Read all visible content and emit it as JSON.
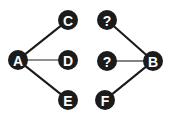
{
  "diagram": {
    "type": "node-link-graph-pair",
    "background_color": "#ffffff",
    "node_color": "#1b1b1b",
    "node_label_color": "#ffffff",
    "edge_color_diagonal": "#1b1b1b",
    "edge_color_horizontal": "#6b6b6b",
    "node_radius": 10,
    "graphs": [
      {
        "id": "left-graph",
        "name": "labeled-graph",
        "nodes": [
          {
            "id": "A",
            "label": "A",
            "x": 18,
            "y": 60
          },
          {
            "id": "C",
            "label": "C",
            "x": 68,
            "y": 20
          },
          {
            "id": "D",
            "label": "D",
            "x": 68,
            "y": 60
          },
          {
            "id": "E",
            "label": "E",
            "x": 68,
            "y": 100
          }
        ],
        "edges": [
          {
            "from": "A",
            "to": "C",
            "style": "diagonal"
          },
          {
            "from": "A",
            "to": "D",
            "style": "horizontal"
          },
          {
            "from": "A",
            "to": "E",
            "style": "diagonal"
          }
        ]
      },
      {
        "id": "right-graph",
        "name": "unknown-graph",
        "nodes": [
          {
            "id": "Q1",
            "label": "?",
            "x": 107,
            "y": 20
          },
          {
            "id": "Q2",
            "label": "?",
            "x": 107,
            "y": 61
          },
          {
            "id": "F",
            "label": "F",
            "x": 105,
            "y": 100
          },
          {
            "id": "B",
            "label": "B",
            "x": 153,
            "y": 61
          }
        ],
        "edges": [
          {
            "from": "Q1",
            "to": "B",
            "style": "diagonal"
          },
          {
            "from": "Q2",
            "to": "B",
            "style": "horizontal"
          },
          {
            "from": "F",
            "to": "B",
            "style": "diagonal"
          }
        ]
      }
    ]
  }
}
